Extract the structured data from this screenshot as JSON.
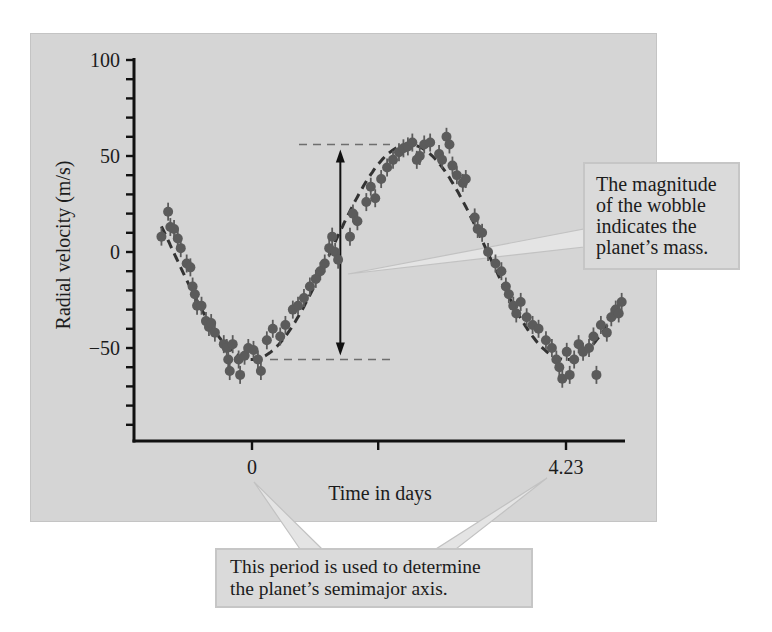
{
  "colors": {
    "frame_bg": "#d5d5d5",
    "axis": "#111111",
    "point": "#5b5b5b",
    "fit_line": "#333333",
    "guide_dash": "#6e6e6e",
    "callout_bg": "#dadada",
    "pointer_fill": "#e4e4e4",
    "pointer_edge": "#c2c2c2"
  },
  "annotations": {
    "mass": {
      "lines": [
        "The magnitude",
        "of the wobble",
        "indicates the",
        "planet’s mass."
      ]
    },
    "period": {
      "lines": [
        "This period is used to determine",
        "the planet’s semimajor axis."
      ]
    }
  },
  "chart_data": {
    "type": "scatter",
    "title": "",
    "xlabel": "Time in days",
    "ylabel": "Radial velocity (m/s)",
    "xlim": [
      -1.6,
      5.0
    ],
    "ylim": [
      -90,
      100
    ],
    "y_ticks_major": [
      100,
      50,
      0,
      -50
    ],
    "y_tick_labels": [
      "100",
      "50",
      "0",
      "−50"
    ],
    "y_minor_step": 10,
    "x_ticks": [
      0,
      1.7,
      4.23
    ],
    "x_tick_labels": [
      "0",
      "",
      "4.23"
    ],
    "grid": false,
    "legend": null,
    "fit": {
      "type": "sinusoid",
      "style": "dashed",
      "amplitude": 56,
      "period_days": 4.23,
      "phase_min_at_t": 0,
      "formula": "v = -56 * cos(2*pi*t/4.23)"
    },
    "guides": {
      "max_line_v": 56,
      "min_line_v": -56,
      "amplitude_arrow_t": 1.19
    },
    "points": [
      [
        -1.22,
        8
      ],
      [
        -1.13,
        21
      ],
      [
        -1.1,
        13
      ],
      [
        -1.05,
        12
      ],
      [
        -1.0,
        7
      ],
      [
        -0.96,
        2
      ],
      [
        -0.88,
        -6
      ],
      [
        -0.83,
        -8
      ],
      [
        -0.8,
        -18
      ],
      [
        -0.77,
        -22
      ],
      [
        -0.74,
        -28
      ],
      [
        -0.68,
        -28
      ],
      [
        -0.62,
        -36
      ],
      [
        -0.58,
        -39
      ],
      [
        -0.55,
        -37
      ],
      [
        -0.5,
        -42
      ],
      [
        -0.38,
        -48
      ],
      [
        -0.34,
        -50
      ],
      [
        -0.32,
        -56
      ],
      [
        -0.3,
        -62
      ],
      [
        -0.26,
        -48
      ],
      [
        -0.18,
        -56
      ],
      [
        -0.16,
        -64
      ],
      [
        -0.1,
        -54
      ],
      [
        -0.05,
        -50
      ],
      [
        0.02,
        -51
      ],
      [
        0.08,
        -56
      ],
      [
        0.12,
        -62
      ],
      [
        0.2,
        -46
      ],
      [
        0.28,
        -40
      ],
      [
        0.38,
        -44
      ],
      [
        0.45,
        -38
      ],
      [
        0.55,
        -30
      ],
      [
        0.62,
        -28
      ],
      [
        0.7,
        -24
      ],
      [
        0.78,
        -18
      ],
      [
        0.86,
        -14
      ],
      [
        0.92,
        -10
      ],
      [
        0.98,
        -6
      ],
      [
        1.04,
        2
      ],
      [
        1.08,
        8
      ],
      [
        1.12,
        0
      ],
      [
        1.16,
        -4
      ],
      [
        1.32,
        8
      ],
      [
        1.36,
        20
      ],
      [
        1.42,
        16
      ],
      [
        1.54,
        26
      ],
      [
        1.6,
        34
      ],
      [
        1.66,
        28
      ],
      [
        1.74,
        38
      ],
      [
        1.82,
        44
      ],
      [
        1.9,
        48
      ],
      [
        1.98,
        52
      ],
      [
        2.04,
        54
      ],
      [
        2.1,
        55
      ],
      [
        2.16,
        57
      ],
      [
        2.22,
        48
      ],
      [
        2.26,
        50
      ],
      [
        2.32,
        56
      ],
      [
        2.4,
        57
      ],
      [
        2.52,
        51
      ],
      [
        2.56,
        48
      ],
      [
        2.62,
        60
      ],
      [
        2.66,
        56
      ],
      [
        2.7,
        45
      ],
      [
        2.76,
        40
      ],
      [
        2.84,
        36
      ],
      [
        2.88,
        38
      ],
      [
        3.0,
        18
      ],
      [
        3.04,
        12
      ],
      [
        3.1,
        10
      ],
      [
        3.18,
        0
      ],
      [
        3.28,
        -6
      ],
      [
        3.36,
        -10
      ],
      [
        3.42,
        -18
      ],
      [
        3.46,
        -22
      ],
      [
        3.52,
        -28
      ],
      [
        3.56,
        -32
      ],
      [
        3.62,
        -26
      ],
      [
        3.7,
        -34
      ],
      [
        3.78,
        -38
      ],
      [
        3.86,
        -40
      ],
      [
        3.96,
        -46
      ],
      [
        4.04,
        -50
      ],
      [
        4.1,
        -56
      ],
      [
        4.14,
        -60
      ],
      [
        4.18,
        -66
      ],
      [
        4.24,
        -52
      ],
      [
        4.28,
        -64
      ],
      [
        4.34,
        -56
      ],
      [
        4.4,
        -48
      ],
      [
        4.46,
        -52
      ],
      [
        4.54,
        -50
      ],
      [
        4.6,
        -44
      ],
      [
        4.64,
        -64
      ],
      [
        4.7,
        -38
      ],
      [
        4.78,
        -42
      ],
      [
        4.84,
        -34
      ],
      [
        4.9,
        -30
      ],
      [
        4.94,
        -32
      ],
      [
        4.98,
        -26
      ]
    ]
  }
}
